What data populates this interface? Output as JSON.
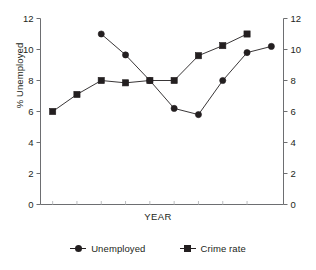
{
  "chart_data": {
    "type": "line",
    "title": "",
    "subtitle": "",
    "xlabel": "YEAR",
    "ylabel": "% Unemployed",
    "ylabel_right": "",
    "ylim": [
      0,
      12
    ],
    "yticks": [
      0,
      2,
      4,
      6,
      8,
      10,
      12
    ],
    "ytick_labels": [
      "0",
      "2",
      "4",
      "6",
      "8",
      "10",
      "12"
    ],
    "ytick_labels_right": [
      "0",
      "2",
      "4",
      "6",
      "8",
      "10",
      "12"
    ],
    "dual_axis": true,
    "grid": false,
    "legend_position": "bottom",
    "x": [
      1,
      2,
      3,
      4,
      5,
      6,
      7,
      8,
      9
    ],
    "xtick_labels": [
      "",
      "",
      "",
      "",
      "",
      "",
      "",
      "",
      ""
    ],
    "series": [
      {
        "name": "Unemployed",
        "marker": "circle",
        "color": "#231f20",
        "x": [
          3,
          4,
          5,
          6,
          7,
          8,
          9,
          10
        ],
        "values": [
          11.0,
          9.65,
          8.0,
          6.2,
          5.8,
          8.0,
          9.8,
          10.2
        ]
      },
      {
        "name": "Crime rate",
        "marker": "square",
        "color": "#231f20",
        "x": [
          1,
          2,
          3,
          4,
          5,
          6,
          7,
          8,
          9
        ],
        "values": [
          6.0,
          7.1,
          8.0,
          7.85,
          8.0,
          8.0,
          9.6,
          10.25,
          11.0
        ]
      }
    ]
  },
  "axes": {
    "y_left_label": "% Unemployed",
    "x_label": "YEAR",
    "y_left_ticks": [
      "12",
      "10",
      "8",
      "6",
      "4",
      "2",
      "0"
    ],
    "y_right_ticks": [
      "12",
      "10",
      "8",
      "6",
      "4",
      "2",
      "0"
    ]
  },
  "legend": {
    "items": [
      {
        "label": "Unemployed",
        "marker": "circle-marker-icon"
      },
      {
        "label": "Crime rate",
        "marker": "square-marker-icon"
      }
    ]
  }
}
